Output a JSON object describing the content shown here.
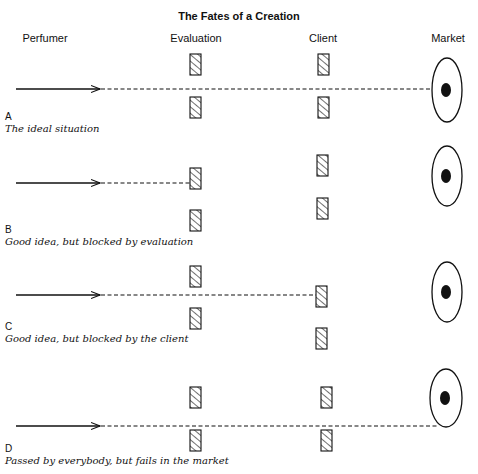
{
  "title": "The Fates of a Creation",
  "columns": [
    {
      "label": "Perfumer",
      "x": 45
    },
    {
      "label": "Evaluation",
      "x": 196
    },
    {
      "label": "Client",
      "x": 323
    },
    {
      "label": "Market",
      "x": 448
    }
  ],
  "rows": [
    {
      "letter": "A",
      "caption": "The ideal situation",
      "line_y": 89,
      "arrow_end_x": 100,
      "dash_end_x": 432,
      "stopped_at": "none",
      "gates": {
        "evaluation": [
          {
            "x": 190,
            "y": 54
          },
          {
            "x": 190,
            "y": 97
          }
        ],
        "client": [
          {
            "x": 318,
            "y": 54
          },
          {
            "x": 318,
            "y": 97
          }
        ]
      },
      "market": {
        "cx": 447,
        "cy": 90,
        "rx": 15,
        "ry": 32,
        "dot_rx": 5,
        "dot_ry": 7
      },
      "letter_y": 120,
      "caption_y": 132
    },
    {
      "letter": "B",
      "caption": "Good idea, but blocked by evaluation",
      "line_y": 183,
      "arrow_end_x": 100,
      "dash_end_x": 190,
      "stopped_at": "evaluation",
      "gates": {
        "evaluation": [
          {
            "x": 190,
            "y": 168
          },
          {
            "x": 190,
            "y": 210
          }
        ],
        "client": [
          {
            "x": 317,
            "y": 155
          },
          {
            "x": 317,
            "y": 198
          }
        ]
      },
      "market": {
        "cx": 447,
        "cy": 176,
        "rx": 15,
        "ry": 30,
        "dot_rx": 5,
        "dot_ry": 7
      },
      "letter_y": 233,
      "caption_y": 245
    },
    {
      "letter": "C",
      "caption": "Good idea, but blocked by the client",
      "line_y": 295,
      "arrow_end_x": 100,
      "dash_end_x": 316,
      "stopped_at": "client",
      "gates": {
        "evaluation": [
          {
            "x": 190,
            "y": 266
          },
          {
            "x": 190,
            "y": 308
          }
        ],
        "client": [
          {
            "x": 316,
            "y": 286
          },
          {
            "x": 316,
            "y": 328
          }
        ]
      },
      "market": {
        "cx": 447,
        "cy": 292,
        "rx": 15,
        "ry": 30,
        "dot_rx": 5,
        "dot_ry": 7
      },
      "letter_y": 330,
      "caption_y": 342
    },
    {
      "letter": "D",
      "caption": "Passed by everybody, but fails in the market",
      "line_y": 426,
      "arrow_end_x": 100,
      "dash_end_x": 438,
      "stopped_at": "market",
      "gates": {
        "evaluation": [
          {
            "x": 190,
            "y": 387
          },
          {
            "x": 190,
            "y": 430
          }
        ],
        "client": [
          {
            "x": 321,
            "y": 387
          },
          {
            "x": 321,
            "y": 430
          }
        ]
      },
      "market": {
        "cx": 446,
        "cy": 398,
        "rx": 16,
        "ry": 29,
        "dot_rx": 5,
        "dot_ry": 7
      },
      "letter_y": 452,
      "caption_y": 464
    }
  ],
  "gate_size": {
    "w": 11,
    "h": 21
  },
  "arrow_start_x": 16
}
